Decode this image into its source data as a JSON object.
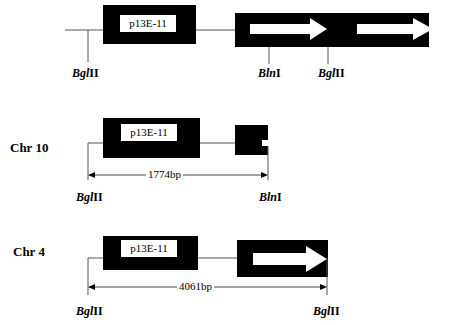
{
  "tracks": [
    {
      "label": "",
      "gene_label": "p13E-11",
      "sites": [
        {
          "italic": "Bgl",
          "roman": "II"
        },
        {
          "italic": "Bln",
          "roman": "I"
        },
        {
          "italic": "Bgl",
          "roman": "II"
        }
      ]
    },
    {
      "label": "Chr 10",
      "gene_label": "p13E-11",
      "fragment_size": "1774bp",
      "sites": [
        {
          "italic": "Bgl",
          "roman": "II"
        },
        {
          "italic": "Bln",
          "roman": "I"
        }
      ]
    },
    {
      "label": "Chr 4",
      "gene_label": "p13E-11",
      "fragment_size": "4061bp",
      "sites": [
        {
          "italic": "Bgl",
          "roman": "II"
        },
        {
          "italic": "Bgl",
          "roman": "II"
        }
      ]
    }
  ]
}
